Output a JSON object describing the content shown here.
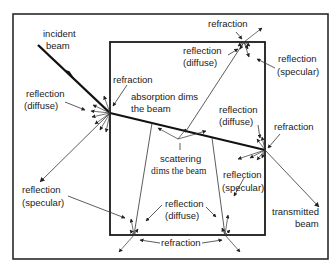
{
  "diagram": {
    "labels": {
      "incident_l1": "incident",
      "incident_l2": "beam",
      "refraction_entry": "refraction",
      "refl_diffuse_left_l1": "reflection",
      "refl_diffuse_left_l2": "(diffuse)",
      "absorption_l1": "absorption dims",
      "absorption_l2": "the beam",
      "refraction_top": "refraction",
      "refl_diffuse_top_l1": "reflection",
      "refl_diffuse_top_l2": "(diffuse)",
      "refl_specular_top_l1": "reflection",
      "refl_specular_top_l2": "(specular)",
      "refl_diffuse_right_l1": "reflection",
      "refl_diffuse_right_l2": "(diffuse)",
      "refraction_right": "refraction",
      "scattering_l1": "scattering",
      "scattering_l2": "dims the beam",
      "refl_specular_left_l1": "reflection",
      "refl_specular_left_l2": "(specular)",
      "refl_specular_right_l1": "reflection",
      "refl_specular_right_l2": "(specular)",
      "refl_diffuse_bottom_l1": "reflection",
      "refl_diffuse_bottom_l2": "(diffuse)",
      "transmitted_l1": "transmitted",
      "transmitted_l2": "beam",
      "refraction_bottom": "refraction"
    },
    "colors": {
      "line": "#111111",
      "background": "#ffffff"
    }
  }
}
